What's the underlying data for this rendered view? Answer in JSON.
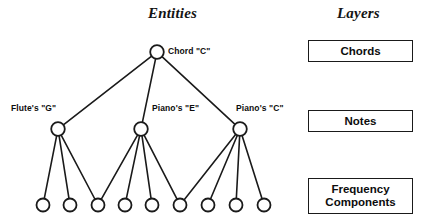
{
  "figure": {
    "columns": {
      "entities_title": "Entities",
      "layers_title": "Layers"
    }
  },
  "graph": {
    "nodes": [
      {
        "id": "chord-c",
        "label": "Chord \"C\"",
        "level": "chords",
        "cx": 157,
        "cy": 52,
        "r": 6.8,
        "label_x": 168,
        "label_y": 46
      },
      {
        "id": "flute-g",
        "label": "Flute's \"G\"",
        "level": "notes",
        "cx": 58,
        "cy": 129,
        "r": 6.8,
        "label_x": 11,
        "label_y": 103
      },
      {
        "id": "piano-e",
        "label": "Piano's \"E\"",
        "level": "notes",
        "cx": 141,
        "cy": 129,
        "r": 6.8,
        "label_x": 152,
        "label_y": 103
      },
      {
        "id": "piano-c",
        "label": "Piano's \"C\"",
        "level": "notes",
        "cx": 240,
        "cy": 129,
        "r": 6.8,
        "label_x": 236,
        "label_y": 103
      },
      {
        "id": "freq-1",
        "label": "",
        "level": "frequency",
        "cx": 43,
        "cy": 205,
        "r": 6.5
      },
      {
        "id": "freq-2",
        "label": "",
        "level": "frequency",
        "cx": 70,
        "cy": 205,
        "r": 6.5
      },
      {
        "id": "freq-3",
        "label": "",
        "level": "frequency",
        "cx": 98,
        "cy": 205,
        "r": 6.5
      },
      {
        "id": "freq-4",
        "label": "",
        "level": "frequency",
        "cx": 125,
        "cy": 205,
        "r": 6.5
      },
      {
        "id": "freq-5",
        "label": "",
        "level": "frequency",
        "cx": 152,
        "cy": 205,
        "r": 6.5
      },
      {
        "id": "freq-6",
        "label": "",
        "level": "frequency",
        "cx": 180,
        "cy": 205,
        "r": 6.5
      },
      {
        "id": "freq-7",
        "label": "",
        "level": "frequency",
        "cx": 208,
        "cy": 205,
        "r": 6.5
      },
      {
        "id": "freq-8",
        "label": "",
        "level": "frequency",
        "cx": 236,
        "cy": 205,
        "r": 6.5
      },
      {
        "id": "freq-9",
        "label": "",
        "level": "frequency",
        "cx": 264,
        "cy": 205,
        "r": 6.5
      }
    ],
    "edges": [
      {
        "from": "chord-c",
        "to": "flute-g"
      },
      {
        "from": "chord-c",
        "to": "piano-e"
      },
      {
        "from": "chord-c",
        "to": "piano-c"
      },
      {
        "from": "flute-g",
        "to": "freq-1"
      },
      {
        "from": "flute-g",
        "to": "freq-2"
      },
      {
        "from": "flute-g",
        "to": "freq-3"
      },
      {
        "from": "piano-e",
        "to": "freq-3"
      },
      {
        "from": "piano-e",
        "to": "freq-4"
      },
      {
        "from": "piano-e",
        "to": "freq-5"
      },
      {
        "from": "piano-e",
        "to": "freq-6"
      },
      {
        "from": "piano-c",
        "to": "freq-6"
      },
      {
        "from": "piano-c",
        "to": "freq-7"
      },
      {
        "from": "piano-c",
        "to": "freq-8"
      },
      {
        "from": "piano-c",
        "to": "freq-9"
      }
    ]
  },
  "layers": [
    {
      "id": "chords",
      "label": "Chords",
      "x": 308,
      "y": 40,
      "w": 105,
      "h": 22
    },
    {
      "id": "notes",
      "label": "Notes",
      "x": 308,
      "y": 110,
      "w": 105,
      "h": 22
    },
    {
      "id": "frequency",
      "label": "Frequency Components",
      "x": 308,
      "y": 178,
      "w": 105,
      "h": 36
    }
  ],
  "colors": {
    "stroke": "#1a1a1a",
    "text": "#0d0d0d",
    "background": "#ffffff"
  }
}
